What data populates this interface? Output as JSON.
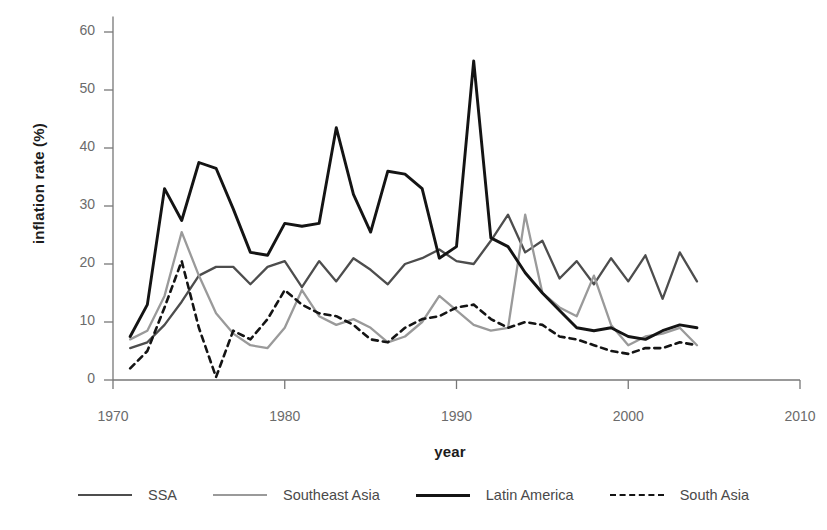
{
  "chart_data": {
    "type": "line",
    "title": "",
    "xlabel": "year",
    "ylabel": "inflation rate (%)",
    "xlim": [
      1970,
      2010
    ],
    "ylim": [
      0,
      62
    ],
    "xticks": [
      1970,
      1980,
      1990,
      2000,
      2010
    ],
    "yticks": [
      0,
      10,
      20,
      30,
      40,
      50,
      60
    ],
    "grid": false,
    "legend_position": "bottom",
    "x": [
      1971,
      1972,
      1973,
      1974,
      1975,
      1976,
      1977,
      1978,
      1979,
      1980,
      1981,
      1982,
      1983,
      1984,
      1985,
      1986,
      1987,
      1988,
      1989,
      1990,
      1991,
      1992,
      1993,
      1994,
      1995,
      1996,
      1997,
      1998,
      1999,
      2000,
      2001,
      2002,
      2003,
      2004
    ],
    "series": [
      {
        "name": "SSA",
        "color": "#4d4d4d",
        "style": "solid",
        "values": [
          5.5,
          6.5,
          9.5,
          13.5,
          18.0,
          19.5,
          19.5,
          16.5,
          19.5,
          20.5,
          16.0,
          20.5,
          17.0,
          21.0,
          19.0,
          16.5,
          20.0,
          21.0,
          22.5,
          20.5,
          20.0,
          24.0,
          28.5,
          22.0,
          24.0,
          17.5,
          20.5,
          16.5,
          21.0,
          17.0,
          21.5,
          14.0,
          22.0,
          17.0
        ]
      },
      {
        "name": "Southeast Asia",
        "color": "#9a9a9a",
        "style": "solid",
        "values": [
          7.0,
          8.5,
          14.5,
          25.5,
          18.0,
          11.5,
          8.0,
          6.0,
          5.5,
          9.0,
          15.5,
          11.0,
          9.5,
          10.5,
          9.0,
          6.5,
          7.5,
          10.0,
          14.5,
          12.0,
          9.5,
          8.5,
          9.0,
          28.5,
          15.0,
          12.5,
          11.0,
          18.0,
          9.5,
          6.0,
          7.5,
          8.0,
          9.0,
          6.0
        ]
      },
      {
        "name": "Latin America",
        "color": "#141414",
        "style": "solid",
        "values": [
          7.5,
          13.0,
          33.0,
          27.5,
          37.5,
          36.5,
          29.5,
          22.0,
          21.5,
          27.0,
          26.5,
          27.0,
          43.5,
          32.0,
          25.5,
          36.0,
          35.5,
          33.0,
          21.0,
          23.0,
          55.0,
          24.5,
          23.0,
          18.5,
          15.0,
          12.0,
          9.0,
          8.5,
          9.0,
          7.5,
          7.0,
          8.5,
          9.5,
          9.0
        ]
      },
      {
        "name": "South Asia",
        "color": "#141414",
        "style": "dashed",
        "values": [
          2.0,
          5.0,
          12.5,
          20.5,
          9.0,
          0.5,
          8.5,
          7.0,
          10.5,
          15.5,
          13.0,
          11.5,
          11.0,
          9.5,
          7.0,
          6.5,
          9.0,
          10.5,
          11.0,
          12.5,
          13.0,
          10.5,
          9.0,
          10.0,
          9.5,
          7.5,
          7.0,
          6.0,
          5.0,
          4.5,
          5.5,
          5.5,
          6.5,
          6.0
        ]
      }
    ]
  },
  "axes": {
    "ytick_labels": [
      "60",
      "50",
      "40",
      "30",
      "20",
      "10",
      "0"
    ],
    "xtick_labels": [
      "1970",
      "1980",
      "1990",
      "2000",
      "2010"
    ]
  },
  "legend": {
    "items": [
      {
        "label": "SSA",
        "color": "#4d4d4d",
        "style": "solid",
        "width": 2.4
      },
      {
        "label": "Southeast Asia",
        "color": "#9a9a9a",
        "style": "solid",
        "width": 2.4
      },
      {
        "label": "Latin America",
        "color": "#141414",
        "style": "solid",
        "width": 3.0
      },
      {
        "label": "South Asia",
        "color": "#141414",
        "style": "dashed",
        "width": 2.6
      }
    ]
  }
}
